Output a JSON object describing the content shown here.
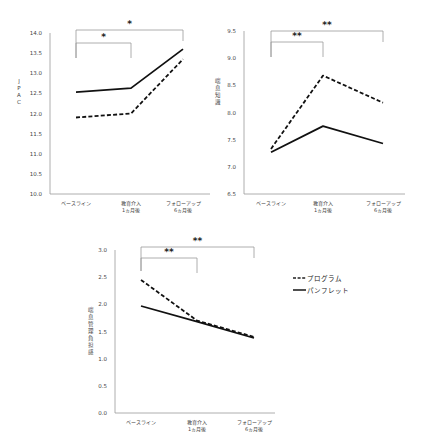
{
  "chart_data": [
    {
      "type": "line",
      "title": "",
      "xlabel": "",
      "ylabel": "JPAC",
      "ylim": [
        10.0,
        14.0
      ],
      "yticks": [
        "10.0",
        "10.5",
        "11.0",
        "11.5",
        "12.0",
        "12.5",
        "13.0",
        "13.5",
        "14.0"
      ],
      "categories": [
        "ベースライン",
        "教育介入\n1ヵ月後",
        "フォローアップ\n6ヵ月後"
      ],
      "series": [
        {
          "name": "プログラム",
          "style": "dashed",
          "values": [
            11.9,
            12.0,
            13.35
          ]
        },
        {
          "name": "パンフレット",
          "style": "solid",
          "values": [
            12.53,
            12.63,
            13.6
          ]
        }
      ],
      "annotations": [
        {
          "from": 0,
          "to": 1,
          "label": "*"
        },
        {
          "from": 0,
          "to": 2,
          "label": "*"
        }
      ],
      "grid": false
    },
    {
      "type": "line",
      "title": "",
      "xlabel": "",
      "ylabel": "喘息知識",
      "ylim": [
        6.5,
        9.5
      ],
      "yticks": [
        "6.5",
        "7.0",
        "7.5",
        "8.0",
        "8.5",
        "9.0",
        "9.5"
      ],
      "categories": [
        "ベースライン",
        "教育介入\n1ヵ月後",
        "フォローアップ\n6ヵ月後"
      ],
      "series": [
        {
          "name": "プログラム",
          "style": "dashed",
          "values": [
            7.33,
            8.68,
            8.18
          ]
        },
        {
          "name": "パンフレット",
          "style": "solid",
          "values": [
            7.27,
            7.75,
            7.43
          ]
        }
      ],
      "annotations": [
        {
          "from": 0,
          "to": 1,
          "label": "**"
        },
        {
          "from": 0,
          "to": 2,
          "label": "**"
        }
      ],
      "grid": false
    },
    {
      "type": "line",
      "title": "",
      "xlabel": "",
      "ylabel": "喘息管理負担感",
      "ylim": [
        0.0,
        3.0
      ],
      "yticks": [
        "0.0",
        "0.5",
        "1.0",
        "1.5",
        "2.0",
        "2.5",
        "3.0"
      ],
      "categories": [
        "ベースライン",
        "教育介入\n1ヵ月後",
        "フォローアップ\n6ヵ月後"
      ],
      "series": [
        {
          "name": "プログラム",
          "style": "dashed",
          "values": [
            2.45,
            1.7,
            1.4
          ]
        },
        {
          "name": "パンフレット",
          "style": "solid",
          "values": [
            1.97,
            1.68,
            1.38
          ]
        }
      ],
      "annotations": [
        {
          "from": 0,
          "to": 1,
          "label": "**"
        },
        {
          "from": 0,
          "to": 2,
          "label": "**"
        }
      ],
      "grid": false,
      "legend_position": "right"
    }
  ],
  "legend": {
    "items": [
      {
        "label": "プログラム",
        "style": "dashed"
      },
      {
        "label": "パンフレット",
        "style": "solid"
      }
    ]
  }
}
